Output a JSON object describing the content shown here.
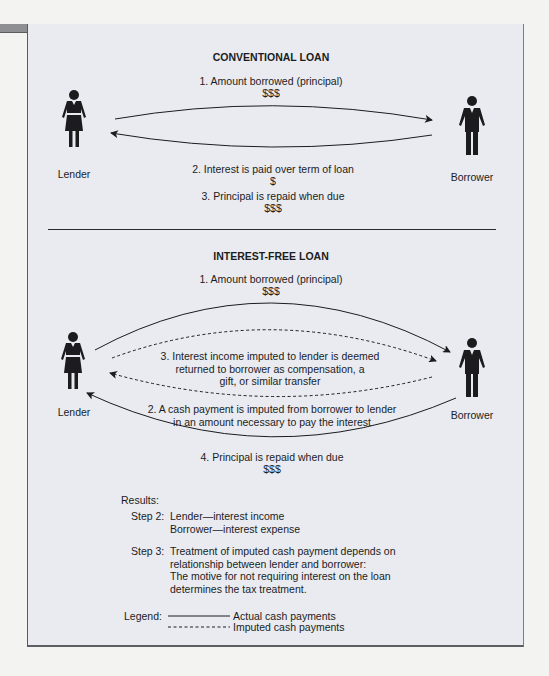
{
  "conventional": {
    "title": "CONVENTIONAL LOAN",
    "step1": "1. Amount borrowed (principal)",
    "step1_amount": "$$$",
    "step2": "2. Interest is paid over term of loan",
    "step2_amount": "$",
    "step3": "3. Principal is repaid when due",
    "step3_amount": "$$$",
    "lender_label": "Lender",
    "borrower_label": "Borrower"
  },
  "interest_free": {
    "title": "INTEREST-FREE LOAN",
    "step1": "1. Amount borrowed (principal)",
    "step1_amount": "$$$",
    "step3_lines": "3. Interest income imputed to lender is deemed\nreturned to borrower as compensation, a\ngift, or similar transfer",
    "step2_lines": "2. A cash payment is imputed from borrower to lender\nin an amount necessary to pay the interest",
    "step4": "4. Principal is repaid when due",
    "step4_amount": "$$$",
    "lender_label": "Lender",
    "borrower_label": "Borrower"
  },
  "results": {
    "heading": "Results:",
    "step2_label": "Step 2:",
    "step2_lines": "Lender—interest income\nBorrower—interest expense",
    "step3_label": "Step 3:",
    "step3_lines": "Treatment of imputed cash payment depends on\nrelationship between lender and borrower:\nThe motive for not requiring interest on the loan\ndetermines the tax treatment."
  },
  "legend": {
    "label": "Legend:",
    "solid": "Actual cash payments",
    "dashed": "Imputed cash payments"
  },
  "colors": {
    "panel_bg": "#e9ebf0",
    "top_bar": "#8e8f93",
    "ink": "#1c1c1e"
  }
}
